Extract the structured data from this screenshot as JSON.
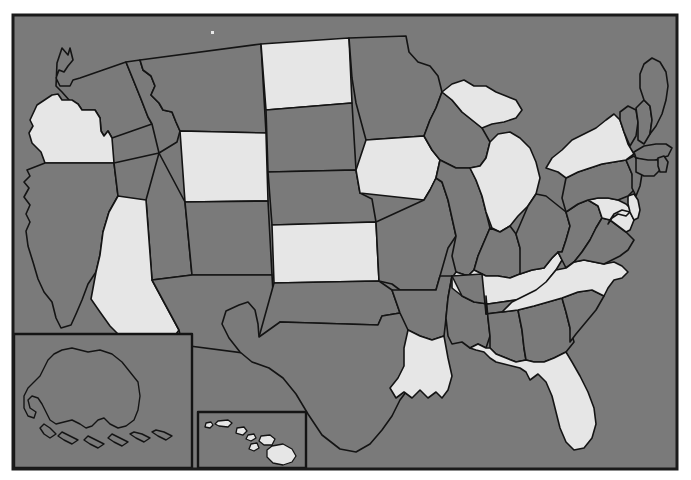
{
  "map": {
    "title": "United States Choropleth Map",
    "projection": "albers-usa",
    "frame": {
      "x": 12,
      "y": 14,
      "width": 666,
      "height": 456,
      "border_color": "#1a1a1a",
      "border_width": 3
    },
    "colors": {
      "background": "#ffffff",
      "unselected_fill": "#7a7a7a",
      "selected_fill": "#e6e6e6",
      "state_border": "#141414",
      "frame_border": "#1a1a1a"
    },
    "legend": {
      "selected_label": "Highlighted",
      "unselected_label": "Not highlighted"
    },
    "insets": [
      {
        "name": "alaska-inset",
        "label": "Alaska",
        "x": 14,
        "y": 334,
        "width": 178,
        "height": 134
      },
      {
        "name": "hawaii-inset",
        "label": "Hawaii",
        "x": 198,
        "y": 412,
        "width": 108,
        "height": 56
      }
    ],
    "artifact": {
      "name": "scan-speck",
      "x": 211,
      "y": 31
    },
    "counts": {
      "selected": 15,
      "total": 51
    },
    "selected_states": [
      "Oregon",
      "Wyoming",
      "Arizona",
      "North Dakota",
      "Iowa",
      "Kansas",
      "Michigan",
      "Kentucky",
      "New York",
      "Maryland",
      "Delaware",
      "North Carolina",
      "Louisiana",
      "Florida",
      "Hawaii"
    ],
    "states": [
      {
        "id": "WA",
        "name": "Washington",
        "selected": false
      },
      {
        "id": "OR",
        "name": "Oregon",
        "selected": true
      },
      {
        "id": "CA",
        "name": "California",
        "selected": false
      },
      {
        "id": "NV",
        "name": "Nevada",
        "selected": false
      },
      {
        "id": "ID",
        "name": "Idaho",
        "selected": false
      },
      {
        "id": "MT",
        "name": "Montana",
        "selected": false
      },
      {
        "id": "WY",
        "name": "Wyoming",
        "selected": true
      },
      {
        "id": "UT",
        "name": "Utah",
        "selected": false
      },
      {
        "id": "AZ",
        "name": "Arizona",
        "selected": true
      },
      {
        "id": "NM",
        "name": "New Mexico",
        "selected": false
      },
      {
        "id": "CO",
        "name": "Colorado",
        "selected": false
      },
      {
        "id": "ND",
        "name": "North Dakota",
        "selected": true
      },
      {
        "id": "SD",
        "name": "South Dakota",
        "selected": false
      },
      {
        "id": "NE",
        "name": "Nebraska",
        "selected": false
      },
      {
        "id": "KS",
        "name": "Kansas",
        "selected": true
      },
      {
        "id": "OK",
        "name": "Oklahoma",
        "selected": false
      },
      {
        "id": "TX",
        "name": "Texas",
        "selected": false
      },
      {
        "id": "MN",
        "name": "Minnesota",
        "selected": false
      },
      {
        "id": "IA",
        "name": "Iowa",
        "selected": true
      },
      {
        "id": "MO",
        "name": "Missouri",
        "selected": false
      },
      {
        "id": "AR",
        "name": "Arkansas",
        "selected": false
      },
      {
        "id": "LA",
        "name": "Louisiana",
        "selected": true
      },
      {
        "id": "WI",
        "name": "Wisconsin",
        "selected": false
      },
      {
        "id": "IL",
        "name": "Illinois",
        "selected": false
      },
      {
        "id": "MS",
        "name": "Mississippi",
        "selected": false
      },
      {
        "id": "MI",
        "name": "Michigan",
        "selected": true
      },
      {
        "id": "IN",
        "name": "Indiana",
        "selected": false
      },
      {
        "id": "KY",
        "name": "Kentucky",
        "selected": true
      },
      {
        "id": "TN",
        "name": "Tennessee",
        "selected": false
      },
      {
        "id": "AL",
        "name": "Alabama",
        "selected": false
      },
      {
        "id": "OH",
        "name": "Ohio",
        "selected": false
      },
      {
        "id": "WV",
        "name": "West Virginia",
        "selected": false
      },
      {
        "id": "GA",
        "name": "Georgia",
        "selected": false
      },
      {
        "id": "FL",
        "name": "Florida",
        "selected": true
      },
      {
        "id": "SC",
        "name": "South Carolina",
        "selected": false
      },
      {
        "id": "NC",
        "name": "North Carolina",
        "selected": true
      },
      {
        "id": "VA",
        "name": "Virginia",
        "selected": false
      },
      {
        "id": "MD",
        "name": "Maryland",
        "selected": true
      },
      {
        "id": "DE",
        "name": "Delaware",
        "selected": true
      },
      {
        "id": "PA",
        "name": "Pennsylvania",
        "selected": false
      },
      {
        "id": "NJ",
        "name": "New Jersey",
        "selected": false
      },
      {
        "id": "NY",
        "name": "New York",
        "selected": true
      },
      {
        "id": "CT",
        "name": "Connecticut",
        "selected": false
      },
      {
        "id": "RI",
        "name": "Rhode Island",
        "selected": false
      },
      {
        "id": "MA",
        "name": "Massachusetts",
        "selected": false
      },
      {
        "id": "VT",
        "name": "Vermont",
        "selected": false
      },
      {
        "id": "NH",
        "name": "New Hampshire",
        "selected": false
      },
      {
        "id": "ME",
        "name": "Maine",
        "selected": false
      },
      {
        "id": "AK",
        "name": "Alaska",
        "selected": false
      },
      {
        "id": "HI",
        "name": "Hawaii",
        "selected": true
      }
    ]
  }
}
